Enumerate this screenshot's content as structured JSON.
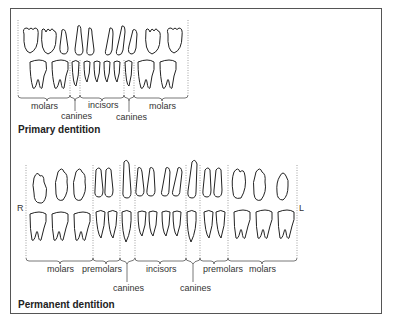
{
  "primary": {
    "title": "Primary dentition",
    "labels": {
      "molars_left": "molars",
      "canines_left": "canines",
      "incisors": "incisors",
      "canines_right": "canines",
      "molars_right": "molars"
    }
  },
  "permanent": {
    "title": "Permanent dentition",
    "side_right": "R",
    "side_left": "L",
    "labels": {
      "molars_left": "molars",
      "premolars_left": "premolars",
      "canines_left": "canines",
      "incisors": "incisors",
      "canines_right": "canines",
      "premolars_right": "premolars",
      "molars_right": "molars"
    }
  }
}
